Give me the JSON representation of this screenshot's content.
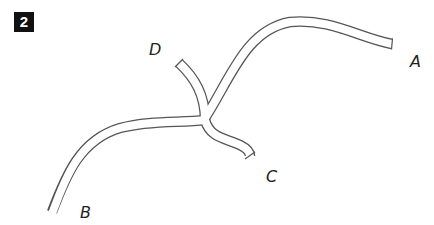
{
  "figure": {
    "number": "2"
  },
  "diagram": {
    "stroke_color": "#555555",
    "fill_color": "#ffffff",
    "ends": [
      {
        "id": "A",
        "label": "A"
      },
      {
        "id": "B",
        "label": "B"
      },
      {
        "id": "C",
        "label": "C"
      },
      {
        "id": "D",
        "label": "D"
      }
    ]
  }
}
